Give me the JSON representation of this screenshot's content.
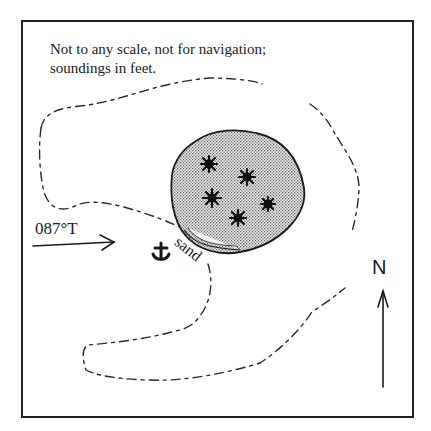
{
  "chart": {
    "disclaimer_lines": [
      "Not to any scale, not for navigation;",
      "soundings in feet."
    ],
    "heading": {
      "label": "087°T",
      "arrow_icon": "approach-arrow"
    },
    "anchorage": {
      "icon": "anchor-icon",
      "glyph": "⚓"
    },
    "shoal": {
      "bottom_label": "sand",
      "rock_markers": 5,
      "fill": "stippled-grey"
    },
    "north": {
      "label": "N",
      "arrow_icon": "north-arrow"
    },
    "colors": {
      "ink": "#1a1a1a",
      "shoal_fill": "#bdbdbd",
      "background": "#ffffff"
    }
  }
}
